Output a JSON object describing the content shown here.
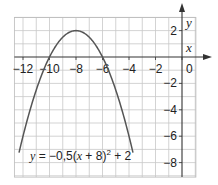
{
  "chart_data": {
    "type": "line",
    "title": "",
    "xlabel": "x",
    "ylabel": "y",
    "xlim": [
      -12.65,
      1.05
    ],
    "ylim": [
      -9.1,
      3.0
    ],
    "grid": true,
    "grid_step": 1,
    "x_ticks": [
      -12,
      -10,
      -8,
      -6,
      -4,
      -2,
      0
    ],
    "x_tick_labels": [
      "−12",
      "−10",
      "−8",
      "−6",
      "−4",
      "−2",
      "0"
    ],
    "y_ticks": [
      2,
      -2,
      -4,
      -6,
      -8
    ],
    "y_tick_labels": [
      "2",
      "−2",
      "−4",
      "−6",
      "−8"
    ],
    "series": [
      {
        "name": "y = −0,5(x + 8)² + 2",
        "function": "-0.5*(x+8)^2+2",
        "vertex": [
          -8,
          2
        ],
        "roots": [
          -10,
          -6
        ],
        "x": [
          -12.3,
          -12,
          -11,
          -10,
          -9,
          -8,
          -7,
          -6,
          -5,
          -4,
          -3.7
        ],
        "values": [
          -7.25,
          -6,
          -2.5,
          0,
          1.5,
          2,
          1.5,
          0,
          -2.5,
          -6,
          -7.25
        ]
      }
    ],
    "annotations": [
      {
        "text": "y = −0,5(x + 8)² + 2",
        "position": [
          -12.2,
          -6.7
        ]
      }
    ],
    "colors": {
      "curve": "#555555",
      "grid": "#c8c8c8",
      "axis": "#333333",
      "text": "#222222"
    }
  },
  "labels": {
    "x_axis": "x",
    "y_axis": "y",
    "equation_prefix": "y",
    "equation_body": " = −0,5(",
    "equation_x": "x",
    "equation_rest": " + 8)",
    "equation_sup": "2",
    "equation_tail": " + 2"
  }
}
